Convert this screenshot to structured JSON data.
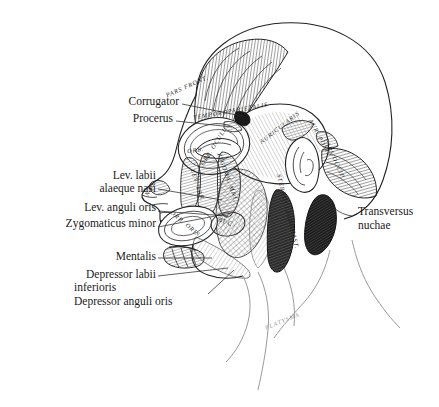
{
  "figure": {
    "type": "anatomical-illustration",
    "view": "left lateral profile, facing left",
    "style": "pen-and-ink line drawing with hatching and stippling",
    "background_color": "#ffffff",
    "ink_color": "#1a1a1a",
    "faint_ink_color": "#9a9a9a"
  },
  "callout_labels": {
    "left_column": [
      {
        "id": "corrugator",
        "text": "Corrugator",
        "align": "right",
        "x": 178,
        "y": 100,
        "leader_to": [
          242,
          116
        ]
      },
      {
        "id": "procerus",
        "text": "Procerus",
        "align": "right",
        "x": 178,
        "y": 118,
        "leader_to": [
          232,
          127
        ]
      },
      {
        "id": "lev-labii-alaeque-nasi",
        "text": "Lev. labii",
        "text2": "alaeque nasi",
        "align": "right",
        "x": 155,
        "y": 176,
        "leader_to": [
          222,
          200
        ]
      },
      {
        "id": "lev-anguli-oris",
        "text": "Lev. anguli oris",
        "align": "right",
        "x": 155,
        "y": 207,
        "leader_to": [
          228,
          215
        ]
      },
      {
        "id": "zygomaticus-minor",
        "text": "Zygomaticus minor",
        "align": "right",
        "x": 155,
        "y": 223,
        "leader_to": [
          232,
          212
        ]
      },
      {
        "id": "mentalis",
        "text": "Mentalis",
        "align": "right",
        "x": 155,
        "y": 254,
        "leader_to": [
          214,
          258
        ]
      },
      {
        "id": "depressor-labii-inferioris",
        "text": "Depressor labii",
        "text2": "inferioris",
        "align": "right",
        "x": 155,
        "y": 272,
        "leader_to": [
          226,
          268
        ]
      },
      {
        "id": "depressor-anguli-oris",
        "text": "Depressor anguli oris",
        "align": "right",
        "x": 205,
        "y": 297,
        "leader_to": [
          232,
          272
        ]
      }
    ],
    "right_column": [
      {
        "id": "transversus-nuchae",
        "text": "Transversus",
        "text2": "nuchae",
        "align": "left",
        "x": 358,
        "y": 212,
        "leader_to": [
          330,
          200
        ]
      }
    ]
  },
  "inline_muscle_labels": [
    {
      "id": "pars-frontalis",
      "text": "PARS FRONT.",
      "x": 188,
      "y": 88,
      "rotate": -24
    },
    {
      "id": "temporoparietalis",
      "text": "TEMPOROPARIETALIS",
      "x": 231,
      "y": 113,
      "rotate": -10
    },
    {
      "id": "auricularis-superior",
      "text": "AURICULARIS",
      "x": 281,
      "y": 129,
      "rotate": -38
    },
    {
      "id": "auricularis-posterior",
      "text": "AUR. POST.",
      "x": 318,
      "y": 138,
      "rotate": 62
    },
    {
      "id": "pars-occipitalis",
      "text": "PARS OCCIP.",
      "x": 333,
      "y": 160,
      "rotate": 66
    },
    {
      "id": "orbicularis-oculi",
      "text": "ORB. OCULI",
      "x": 215,
      "y": 148,
      "rotate": -58
    },
    {
      "id": "orbicularis-oculi-2",
      "text": "ORB.",
      "x": 196,
      "y": 152,
      "rotate": -8
    },
    {
      "id": "nasalis",
      "text": "NAS.",
      "x": 152,
      "y": 189,
      "rotate": -62
    },
    {
      "id": "levator-labii",
      "text": "LEV. LAB.",
      "x": 196,
      "y": 186,
      "rotate": 72
    },
    {
      "id": "zygomaticus-major",
      "text": "ZYGOMA. MAJ.",
      "x": 226,
      "y": 178,
      "rotate": 70
    },
    {
      "id": "orbicularis-oris",
      "text": "ORB. ORIS",
      "x": 184,
      "y": 225,
      "rotate": 40
    },
    {
      "id": "buccinator",
      "text": "BUC.",
      "x": 226,
      "y": 224,
      "rotate": 18
    },
    {
      "id": "sternocleidomastoid",
      "text": "STERNOCLEIDOMAST.",
      "x": 286,
      "y": 212,
      "rotate": 76
    },
    {
      "id": "platysma",
      "text": "PLATYSMA",
      "x": 283,
      "y": 323,
      "rotate": -22,
      "faint": true
    }
  ],
  "anatomical_regions": [
    {
      "id": "cranial-vault",
      "label": "cranium outline"
    },
    {
      "id": "frontalis-belly",
      "label": "frontal belly of occipitofrontalis, vertical fibers"
    },
    {
      "id": "galea",
      "label": "temporoparietalis / galea aponeurotica"
    },
    {
      "id": "ear",
      "label": "auricle"
    },
    {
      "id": "occipital-belly",
      "label": "occipital belly of occipitofrontalis"
    },
    {
      "id": "transversus-nuchae-muscle",
      "label": "transversus nuchae, dark shaded"
    },
    {
      "id": "masseter",
      "label": "masseter, cross-hatched"
    },
    {
      "id": "sternocleidomastoid-muscle",
      "label": "sternocleidomastoid, dark shaded"
    },
    {
      "id": "neck-shoulder",
      "label": "neck and shoulder contour, faint"
    }
  ]
}
